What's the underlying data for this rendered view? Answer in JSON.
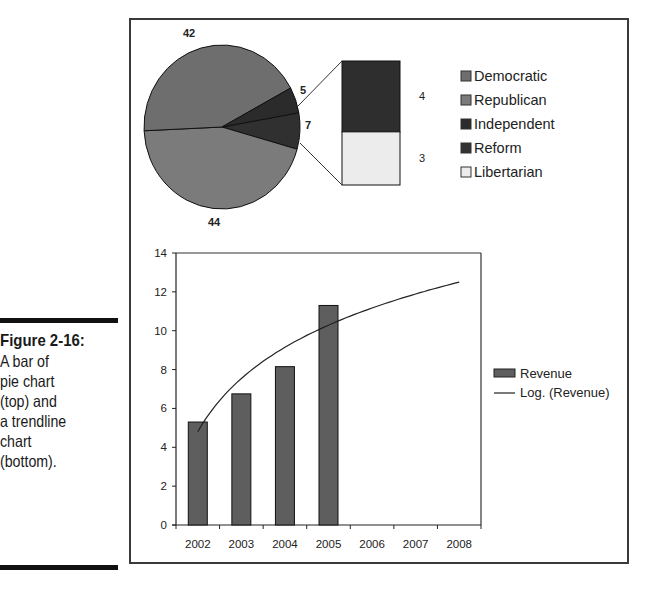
{
  "figure": {
    "title": "Figure 2-16:",
    "caption_lines": [
      "A bar of",
      "pie chart",
      "(top) and",
      "a trendline",
      "chart",
      "(bottom)."
    ]
  },
  "chart_data": [
    {
      "type": "pie",
      "subtype": "bar-of-pie",
      "title": "",
      "slices": [
        {
          "name": "Democratic",
          "value": 42,
          "color": "#6e6e6e"
        },
        {
          "name": "Republican",
          "value": 44,
          "color": "#7b7b7b"
        },
        {
          "name": "Independent",
          "value": 5,
          "color": "#2b2b2b"
        },
        {
          "name": "Other (Reform + Libertarian)",
          "value": 7,
          "color": "#303030"
        }
      ],
      "secondary_bar": [
        {
          "name": "Reform",
          "value": 4,
          "color": "#2e2e2e"
        },
        {
          "name": "Libertarian",
          "value": 3,
          "color": "#ececec"
        }
      ],
      "data_labels": [
        "42",
        "5",
        "7",
        "44",
        "4",
        "3"
      ],
      "legend": {
        "position": "right",
        "entries": [
          {
            "label": "Democratic",
            "color": "#6e6e6e"
          },
          {
            "label": "Republican",
            "color": "#7b7b7b"
          },
          {
            "label": "Independent",
            "color": "#2b2b2b"
          },
          {
            "label": "Reform",
            "color": "#333333"
          },
          {
            "label": "Libertarian",
            "color": "#ececec"
          }
        ]
      }
    },
    {
      "type": "bar",
      "title": "",
      "categories": [
        "2002",
        "2003",
        "2004",
        "2005",
        "2006",
        "2007",
        "2008"
      ],
      "series": [
        {
          "name": "Revenue",
          "type": "bar",
          "color": "#5e5e5e",
          "values": [
            5.3,
            6.75,
            8.15,
            11.3,
            null,
            null,
            null
          ]
        },
        {
          "name": "Log. (Revenue)",
          "type": "line",
          "trendline": "logarithmic",
          "color": "#222222",
          "values": [
            4.8,
            7.4,
            9.0,
            10.1,
            11.0,
            11.8,
            12.5
          ]
        }
      ],
      "xlabel": "",
      "ylabel": "",
      "ylim": [
        0,
        14
      ],
      "yticks": [
        "0",
        "2",
        "4",
        "6",
        "8",
        "10",
        "12",
        "14"
      ],
      "grid": false,
      "legend": {
        "position": "right",
        "entries": [
          {
            "label": "Revenue",
            "kind": "bar"
          },
          {
            "label": "Log. (Revenue)",
            "kind": "line"
          }
        ]
      }
    }
  ]
}
